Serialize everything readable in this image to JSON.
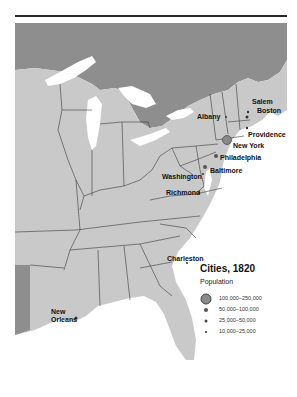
{
  "map": {
    "title": "Cities, 1820",
    "colors": {
      "land_us": "#c9c9c9",
      "land_foreign": "#8e8e8e",
      "water": "#ffffff",
      "borders": "#3a3a3a",
      "rule": "#2a2a2a"
    },
    "cities": [
      {
        "name": "Salem",
        "size_class": "10,000–25,000"
      },
      {
        "name": "Boston",
        "size_class": "25,000–50,000"
      },
      {
        "name": "Albany",
        "size_class": "10,000–25,000"
      },
      {
        "name": "Providence",
        "size_class": "10,000–25,000"
      },
      {
        "name": "New York",
        "size_class": "100,000–250,000"
      },
      {
        "name": "Philadelphia",
        "size_class": "50,000–100,000"
      },
      {
        "name": "Baltimore",
        "size_class": "50,000–100,000"
      },
      {
        "name": "Washington",
        "size_class": "10,000–25,000"
      },
      {
        "name": "Richmond",
        "size_class": "10,000–25,000"
      },
      {
        "name": "Charleston",
        "size_class": "10,000–25,000"
      },
      {
        "name": "New Orleans",
        "size_class": "25,000–50,000"
      }
    ],
    "legend": {
      "title": "Cities, 1820",
      "subtitle": "Population",
      "items": [
        {
          "label": "100,000–250,000",
          "symbol": "large-circle"
        },
        {
          "label": "50,000–100,000",
          "symbol": "medium-dot"
        },
        {
          "label": "25,000–50,000",
          "symbol": "small-dot"
        },
        {
          "label": "10,000–25,000",
          "symbol": "tiny-dot"
        }
      ]
    }
  }
}
